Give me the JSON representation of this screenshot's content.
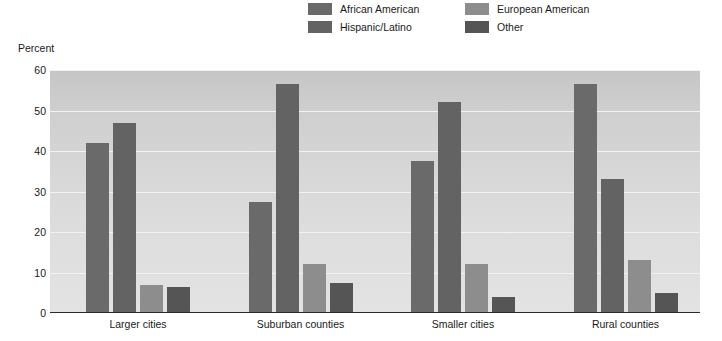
{
  "legend": {
    "items": [
      {
        "label": "African American",
        "color": "#6a6a6a",
        "icon": "legend-swatch-icon"
      },
      {
        "label": "European American",
        "color": "#8d8d8d",
        "icon": "legend-swatch-icon"
      },
      {
        "label": "Hispanic/Latino",
        "color": "#636363",
        "icon": "legend-swatch-icon"
      },
      {
        "label": "Other",
        "color": "#555555",
        "icon": "legend-swatch-icon"
      }
    ]
  },
  "axis": {
    "y_title": "Percent",
    "y_ticks": [
      "0",
      "10",
      "20",
      "30",
      "40",
      "50",
      "60"
    ]
  },
  "chart_data": {
    "type": "bar",
    "title": "",
    "subtitle": "",
    "xlabel": "",
    "ylabel": "Percent",
    "ylim": [
      0,
      60
    ],
    "ytick_step": 10,
    "grid": true,
    "legend_position": "top-center",
    "categories": [
      "Larger cities",
      "Suburban counties",
      "Smaller cities",
      "Rural counties"
    ],
    "series": [
      {
        "name": "African American",
        "color": "#6a6a6a",
        "values": [
          42.0,
          27.5,
          37.5,
          56.5
        ]
      },
      {
        "name": "Hispanic/Latino",
        "color": "#636363",
        "values": [
          47.0,
          56.5,
          52.0,
          33.0
        ]
      },
      {
        "name": "European American",
        "color": "#8d8d8d",
        "values": [
          7.0,
          12.0,
          12.0,
          13.0
        ]
      },
      {
        "name": "Other",
        "color": "#555555",
        "values": [
          6.5,
          7.5,
          4.0,
          5.0
        ]
      }
    ]
  }
}
